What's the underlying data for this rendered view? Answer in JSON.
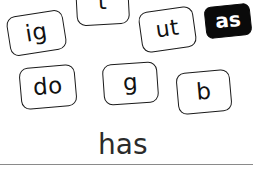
{
  "page": {
    "title": "has",
    "background_color": "#ffffff",
    "ink_color": "#111111",
    "selected_tile_color": "#0a0a0a",
    "rule_color": "#8a8a8a",
    "width": 253,
    "height": 189
  },
  "tiles": [
    {
      "id": "tile-ig",
      "label": "ig",
      "selected": false,
      "x": 8,
      "y": 13,
      "w": 57,
      "h": 40,
      "rotation": -9,
      "font_size": 23
    },
    {
      "id": "tile-t",
      "label": "t",
      "selected": false,
      "x": 76,
      "y": -20,
      "w": 53,
      "h": 45,
      "rotation": -3,
      "font_size": 22
    },
    {
      "id": "tile-ut",
      "label": "ut",
      "selected": false,
      "x": 140,
      "y": 9,
      "w": 55,
      "h": 41,
      "rotation": -8,
      "font_size": 22
    },
    {
      "id": "tile-as",
      "label": "as",
      "selected": true,
      "x": 205,
      "y": 5,
      "w": 46,
      "h": 32,
      "rotation": -6,
      "font_size": 20
    },
    {
      "id": "tile-do",
      "label": "do",
      "selected": false,
      "x": 20,
      "y": 66,
      "w": 56,
      "h": 42,
      "rotation": -5,
      "font_size": 23
    },
    {
      "id": "tile-g",
      "label": "g",
      "selected": false,
      "x": 103,
      "y": 63,
      "w": 55,
      "h": 41,
      "rotation": -4,
      "font_size": 23
    },
    {
      "id": "tile-b",
      "label": "b",
      "selected": false,
      "x": 177,
      "y": 71,
      "w": 54,
      "h": 42,
      "rotation": -5,
      "font_size": 23
    }
  ],
  "answer": {
    "word": "has",
    "x": 98,
    "y": 131,
    "font_size": 28
  },
  "rule": {
    "x": 0,
    "y": 164,
    "w": 253,
    "h": 1
  }
}
